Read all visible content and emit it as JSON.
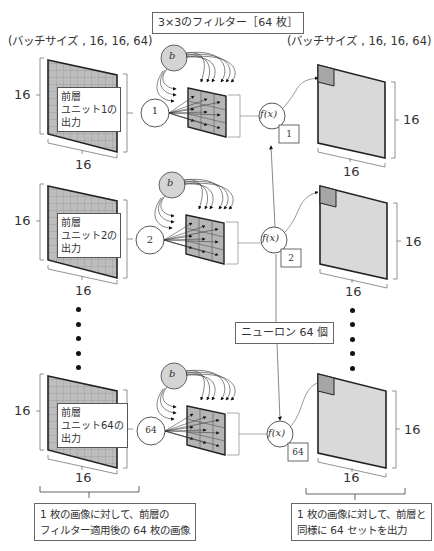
{
  "header": {
    "left_shape": "(バッチサイズ , 16, 16, 64)",
    "filter_box": "3×3のフィルター［64 枚］",
    "right_shape": "(バッチサイズ , 16, 16, 64)"
  },
  "rows": [
    {
      "input_label": "前層\nユニット1の\n出力",
      "unit_node": "1",
      "bias_node": "b",
      "activation": "f(x)",
      "neuron_index": "1",
      "height_dim": "16",
      "width_dim": "16",
      "out_height_dim": "16",
      "out_width_dim": "16"
    },
    {
      "input_label": "前層\nユニット2の\n出力",
      "unit_node": "2",
      "bias_node": "b",
      "activation": "f(x)",
      "neuron_index": "2",
      "height_dim": "16",
      "width_dim": "16",
      "out_height_dim": "16",
      "out_width_dim": "16"
    },
    {
      "input_label": "前層\nユニット64の\n出力",
      "unit_node": "64",
      "bias_node": "b",
      "activation": "f(x)",
      "neuron_index": "64",
      "height_dim": "16",
      "width_dim": "16",
      "out_height_dim": "16",
      "out_width_dim": "16"
    }
  ],
  "neuron_count_box": "ニューロン 64 個",
  "footer": {
    "left_note_line1": "1 枚の画像に対して、前層の",
    "left_note_line2": "フィルター適用後の 64 枚の画像",
    "right_note_line1": "1 枚の画像に対して、前層と",
    "right_note_line2": "同様に 64 セットを出力"
  },
  "colors": {
    "input_plane": "#bdbdbd",
    "grid_line": "#8a8a8a",
    "filter_fill": "#b5b5b5",
    "output_plane": "#d9d9d9",
    "output_cell": "#a6a6a6",
    "bias_node": "#d4d4d4",
    "stroke": "#222222"
  }
}
